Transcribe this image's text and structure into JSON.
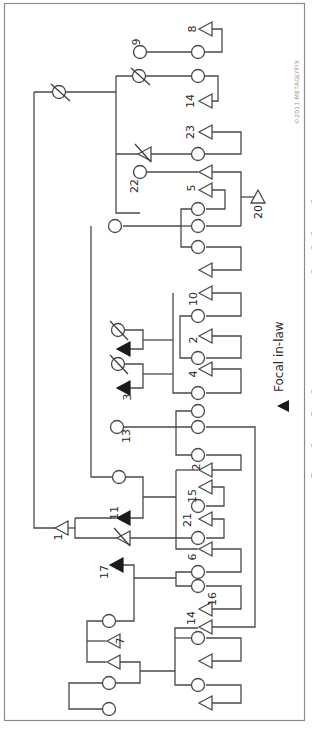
{
  "figure": {
    "orientation": "rotated-90-clockwise",
    "border_color": "#8a8a8a",
    "line_color": "#4a4a4a",
    "copyright": "©2011 METAGLYFIX",
    "legend": {
      "symbol": "filled-triangle",
      "label": "Focal in-law"
    },
    "caption_visible": false
  },
  "node_labels": {
    "n1": "1",
    "n2a": "2",
    "n2b": "2",
    "n3": "3",
    "n4": "4",
    "n5": "5",
    "n6": "6",
    "n7": "7",
    "n8": "8",
    "n9": "9",
    "n10": "10",
    "n11": "11",
    "n13": "13",
    "n14a": "14",
    "n14b": "14",
    "n15": "15",
    "n16": "16",
    "n17": "17",
    "n20": "20",
    "n21": "21",
    "n22": "22",
    "n23": "23"
  },
  "symbols_legend": {
    "circle": "female",
    "triangle": "male",
    "filled_triangle": "focal in-law",
    "slashed": "deceased"
  }
}
